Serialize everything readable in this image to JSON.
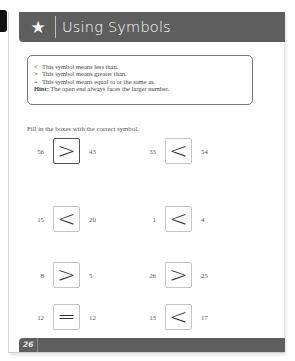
{
  "header": {
    "icon": "star-icon",
    "title": "Using Symbols"
  },
  "infobox": {
    "lines": [
      {
        "symbol": "<",
        "text": "This symbol means less than."
      },
      {
        "symbol": ">",
        "text": "This symbol means greater than."
      },
      {
        "symbol": "=",
        "text": "This symbol means equal to or the same as."
      }
    ],
    "hint_label": "Hint:",
    "hint_text": "The open end always faces the larger number."
  },
  "instruction": "Fill in the boxes with the correct symbol.",
  "problems": [
    {
      "left": "56",
      "symbol": ">",
      "right": "43"
    },
    {
      "left": "33",
      "symbol": "<",
      "right": "54"
    },
    {
      "left": "15",
      "symbol": "<",
      "right": "20"
    },
    {
      "left": "1",
      "symbol": "<",
      "right": "4"
    },
    {
      "left": "8",
      "symbol": ">",
      "right": "5"
    },
    {
      "left": "26",
      "symbol": ">",
      "right": "25"
    },
    {
      "left": "12",
      "symbol": "=",
      "right": "12"
    },
    {
      "left": "13",
      "symbol": "<",
      "right": "17"
    }
  ],
  "footer": {
    "page_number": "26"
  },
  "colors": {
    "header_bg": "#5e5e5e",
    "header_text": "#ffffff",
    "box_border": "#c5c5c5",
    "active_box_border": "#555555"
  }
}
